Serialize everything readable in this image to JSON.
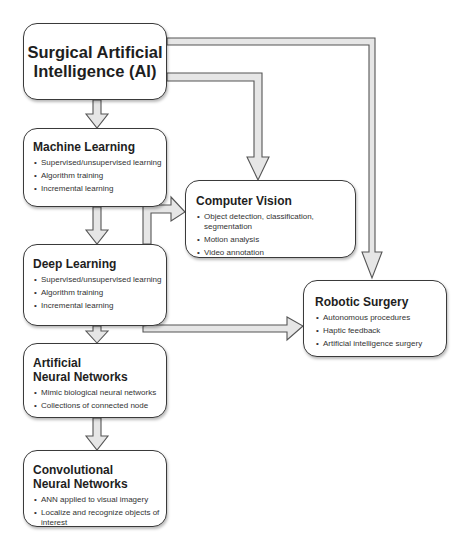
{
  "diagram": {
    "nodes": {
      "ai": {
        "title": "Surgical Artificial Intelligence (AI)",
        "items": []
      },
      "ml": {
        "title": "Machine Learning",
        "items": [
          "Supervised/unsupervised learning",
          "Algorithm training",
          "Incremental learning"
        ]
      },
      "cv": {
        "title": "Computer Vision",
        "items": [
          "Object detection, classification, segmentation",
          "Motion analysis",
          "Video annotation"
        ]
      },
      "dl": {
        "title": "Deep Learning",
        "items": [
          "Supervised/unsupervised learning",
          "Algorithm training",
          "Incremental learning"
        ]
      },
      "rs": {
        "title": "Robotic Surgery",
        "items": [
          "Autonomous procedures",
          "Haptic feedback",
          "Artificial intelligence surgery"
        ]
      },
      "ann": {
        "title_line1": "Artificial",
        "title_line2": "Neural Networks",
        "items": [
          "Mimic biological neural networks",
          "Collections of connected node"
        ]
      },
      "cnn": {
        "title_line1": "Convolutional",
        "title_line2": "Neural Networks",
        "items": [
          "ANN applied to visual imagery",
          "Localize and recognize objects of interest"
        ]
      }
    },
    "edges": [
      {
        "from": "Surgical Artificial Intelligence (AI)",
        "to": "Machine Learning"
      },
      {
        "from": "Surgical Artificial Intelligence (AI)",
        "to": "Computer Vision"
      },
      {
        "from": "Surgical Artificial Intelligence (AI)",
        "to": "Robotic Surgery"
      },
      {
        "from": "Machine Learning",
        "to": "Deep Learning"
      },
      {
        "from": "Deep Learning",
        "to": "Computer Vision"
      },
      {
        "from": "Deep Learning",
        "to": "Robotic Surgery"
      },
      {
        "from": "Deep Learning",
        "to": "Artificial Neural Networks"
      },
      {
        "from": "Artificial Neural Networks",
        "to": "Convolutional Neural Networks"
      }
    ],
    "colors": {
      "box_border": "#3a3a3a",
      "arrow_fill": "#e6e6e6",
      "arrow_stroke": "#555555",
      "background": "#ffffff"
    }
  }
}
